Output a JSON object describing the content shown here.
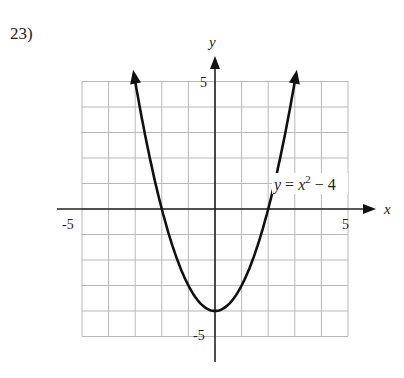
{
  "problem": {
    "number_label": "23)"
  },
  "chart_data": {
    "type": "line",
    "title": "",
    "function": "y = x^2 - 4",
    "xlabel": "x",
    "ylabel": "y",
    "xlim": [
      -5,
      5
    ],
    "ylim": [
      -5,
      5
    ],
    "grid": true,
    "grid_step": 1,
    "x_tick_labels": [
      "-5",
      "5"
    ],
    "y_tick_labels": [
      "5",
      "-5"
    ],
    "vertex": [
      0,
      -4
    ],
    "x_intercepts": [
      -2,
      2
    ],
    "arrows_at_ends": true,
    "annotation": {
      "text_y": "y",
      "text_eq": " = ",
      "text_x": "x",
      "text_exp": "2",
      "text_tail": " − 4"
    },
    "points": [
      {
        "x": -2.9,
        "y": 4.41
      },
      {
        "x": -2.5,
        "y": 2.25
      },
      {
        "x": -2,
        "y": 0
      },
      {
        "x": -1.5,
        "y": -1.75
      },
      {
        "x": -1,
        "y": -3
      },
      {
        "x": -0.5,
        "y": -3.75
      },
      {
        "x": 0,
        "y": -4
      },
      {
        "x": 0.5,
        "y": -3.75
      },
      {
        "x": 1,
        "y": -3
      },
      {
        "x": 1.5,
        "y": -1.75
      },
      {
        "x": 2,
        "y": 0
      },
      {
        "x": 2.5,
        "y": 2.25
      },
      {
        "x": 2.9,
        "y": 4.41
      }
    ]
  },
  "colors": {
    "grid": "#b8b8b8",
    "axis": "#222222",
    "curve": "#111111",
    "background": "#ffffff"
  }
}
